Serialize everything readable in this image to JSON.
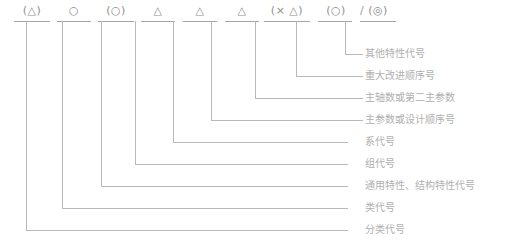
{
  "diagram": {
    "line_color": "#b9b9b9",
    "symbol_color": "#9a9a9a",
    "text_color": "#b0b0b0",
    "separator": "/",
    "symbols": [
      {
        "id": "s1",
        "glyph": "(△)",
        "x": 12,
        "width": 40
      },
      {
        "id": "s2",
        "glyph": "○",
        "x": 54,
        "width": 40
      },
      {
        "id": "s3",
        "glyph": "(○)",
        "x": 96,
        "width": 40
      },
      {
        "id": "s4",
        "glyph": "△",
        "x": 138,
        "width": 40
      },
      {
        "id": "s5",
        "glyph": "△",
        "x": 180,
        "width": 40
      },
      {
        "id": "s6",
        "glyph": "△",
        "x": 222,
        "width": 40
      },
      {
        "id": "s7",
        "glyph": "(× △)",
        "x": 262,
        "width": 50
      },
      {
        "id": "s8",
        "glyph": "(○)",
        "x": 316,
        "width": 40
      },
      {
        "id": "s10",
        "glyph": "(◎)",
        "x": 358,
        "width": 40
      }
    ],
    "labels": [
      {
        "id": "l1",
        "text": "其他特性代号",
        "y": 54
      },
      {
        "id": "l2",
        "text": "重大改进顺序号",
        "y": 76
      },
      {
        "id": "l3",
        "text": "主轴数或第二主参数",
        "y": 98
      },
      {
        "id": "l4",
        "text": "主参数或设计顺序号",
        "y": 120
      },
      {
        "id": "l5",
        "text": "系代号",
        "y": 142
      },
      {
        "id": "l6",
        "text": "组代号",
        "y": 164
      },
      {
        "id": "l7",
        "text": "通用特性、结构特性代号",
        "y": 186
      },
      {
        "id": "l8",
        "text": "类代号",
        "y": 208
      },
      {
        "id": "l9",
        "text": "分类代号",
        "y": 230
      }
    ]
  }
}
